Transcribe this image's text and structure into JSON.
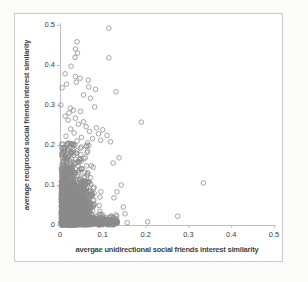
{
  "page": {
    "background": "#fbfbf9",
    "chart_background": "#ffffff",
    "frame_border_color": "#c9c9c9"
  },
  "style": {
    "axis_line_color": "#bfbfbf",
    "tick_text_color": "#404040",
    "axis_title_color": "#3f3f3f",
    "marker_stroke_color": "#8a8a8a"
  },
  "chart_data": {
    "type": "scatter",
    "title": "",
    "xlabel": "avergae unidirectional social friends interest similarity",
    "ylabel": "average reciprocal social friends interest similarity",
    "xlim": [
      0,
      0.5
    ],
    "ylim": [
      0,
      0.5
    ],
    "grid": false,
    "legend": null,
    "xticks": [
      0,
      0.1,
      0.2,
      0.3,
      0.4,
      0.5
    ],
    "xtick_labels": [
      "0",
      "0.1",
      "0.2",
      "0.3",
      "0.4",
      "0.5"
    ],
    "yticks": [
      0,
      0.1,
      0.2,
      0.3,
      0.4,
      0.5
    ],
    "ytick_labels": [
      "0",
      "0.1",
      "0.2",
      "0.3",
      "0.4",
      "0.5"
    ],
    "marker": {
      "shape": "open-circle",
      "radius_px": 2.3,
      "stroke_width": 0.9,
      "opacity": 0.85
    },
    "outlier_points": [
      [
        0.114,
        0.492
      ],
      [
        0.04,
        0.458
      ],
      [
        0.036,
        0.44
      ],
      [
        0.041,
        0.43
      ],
      [
        0.035,
        0.419
      ],
      [
        0.114,
        0.418
      ],
      [
        0.026,
        0.397
      ],
      [
        0.012,
        0.378
      ],
      [
        0.036,
        0.371
      ],
      [
        0.047,
        0.367
      ],
      [
        0.066,
        0.362
      ],
      [
        0.038,
        0.357
      ],
      [
        0.015,
        0.352
      ],
      [
        0.005,
        0.343
      ],
      [
        0.067,
        0.345
      ],
      [
        0.083,
        0.339
      ],
      [
        0.131,
        0.333
      ],
      [
        0.055,
        0.325
      ],
      [
        0.071,
        0.317
      ],
      [
        0.002,
        0.3
      ],
      [
        0.081,
        0.295
      ],
      [
        0.024,
        0.292
      ],
      [
        0.031,
        0.287
      ],
      [
        0.048,
        0.284
      ],
      [
        0.021,
        0.28
      ],
      [
        0.012,
        0.272
      ],
      [
        0.036,
        0.267
      ],
      [
        0.019,
        0.262
      ],
      [
        0.055,
        0.258
      ],
      [
        0.19,
        0.257
      ],
      [
        0.043,
        0.252
      ],
      [
        0.061,
        0.246
      ],
      [
        0.085,
        0.243
      ],
      [
        0.025,
        0.24
      ],
      [
        0.1,
        0.238
      ],
      [
        0.069,
        0.234
      ],
      [
        0.033,
        0.23
      ],
      [
        0.09,
        0.228
      ],
      [
        0.11,
        0.224
      ],
      [
        0.014,
        0.222
      ],
      [
        0.05,
        0.219
      ],
      [
        0.076,
        0.216
      ],
      [
        0.095,
        0.212
      ],
      [
        0.04,
        0.21
      ],
      [
        0.118,
        0.208
      ],
      [
        0.064,
        0.205
      ],
      [
        0.028,
        0.203
      ],
      [
        0.138,
        0.168
      ],
      [
        0.124,
        0.155
      ],
      [
        0.143,
        0.1
      ],
      [
        0.133,
        0.083
      ],
      [
        0.126,
        0.068
      ],
      [
        0.157,
        0.006
      ],
      [
        0.205,
        0.008
      ],
      [
        0.275,
        0.022
      ],
      [
        0.335,
        0.105
      ],
      [
        0.148,
        0.045
      ],
      [
        0.152,
        0.028
      ]
    ],
    "dense_cluster": {
      "description": "approx. 2400 heavily overlapping gray open-circle points concentrated near the origin: x mostly 0-0.13, y mostly 0-0.2, density highest for x 0.01-0.08 and y 0-0.1, with a dark band hugging y=0 out to x=0.135 and points hugging the y-axis",
      "count": 2400,
      "seed": 20240613,
      "x_abs_gauss_sigma": 0.03,
      "x_offset": 0.003,
      "x_max": 0.138,
      "y_abs_gauss_sigma": 0.052,
      "y_max": 0.205,
      "mid_uniform_fraction": 0.12,
      "mid_uniform_y_range": [
        0.02,
        0.205
      ],
      "bottom_band_fraction": 0.12,
      "bottom_band_y_sigma": 0.01,
      "bottom_band_x_range": [
        0.002,
        0.135
      ]
    }
  }
}
